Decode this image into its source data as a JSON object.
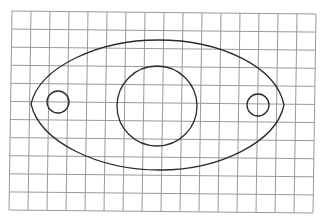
{
  "diagram": {
    "type": "drawing-on-graph-paper",
    "canvas": {
      "width": 320,
      "height": 217,
      "background": "#ffffff"
    },
    "grid": {
      "columns": 16,
      "rows": 11,
      "color": "#9a9a9a",
      "corners": {
        "top_left": [
          12,
          11
        ],
        "top_right": [
          316,
          14
        ],
        "bottom_right": [
          313,
          213
        ],
        "bottom_left": [
          9,
          210
        ]
      }
    },
    "shapes": [
      {
        "name": "outer-lens-outline",
        "kind": "path",
        "color": "#2a2a2a",
        "d": "M 31 104 C 40 66, 100 40, 158 40 C 220 40, 276 66, 284 105 C 276 142, 220 170, 160 170 C 98 170, 40 142, 31 104 Z"
      },
      {
        "name": "center-large-circle",
        "kind": "circle",
        "color": "#2a2a2a",
        "cx": 157,
        "cy": 106,
        "r": 40
      },
      {
        "name": "left-small-circle",
        "kind": "circle",
        "color": "#2a2a2a",
        "cx": 58,
        "cy": 102,
        "r": 11
      },
      {
        "name": "right-small-circle",
        "kind": "circle",
        "color": "#2a2a2a",
        "cx": 258,
        "cy": 105,
        "r": 11
      }
    ]
  }
}
